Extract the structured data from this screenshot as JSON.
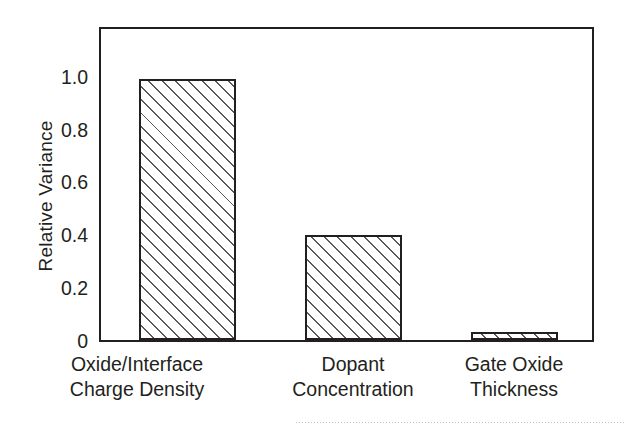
{
  "chart_data": {
    "type": "bar",
    "title": "",
    "xlabel": "",
    "ylabel": "Relative Variance",
    "categories": [
      "Oxide/Interface Charge Density",
      "Dopant Concentration",
      "Gate Oxide Thickness"
    ],
    "category_lines": [
      [
        "Oxide/Interface",
        "Charge Density"
      ],
      [
        "Dopant",
        "Concentration"
      ],
      [
        "Gate Oxide",
        "Thickness"
      ]
    ],
    "values": [
      1.0,
      0.4,
      0.03
    ],
    "ylim": [
      0,
      1.19
    ],
    "yticks": [
      0,
      0.2,
      0.4,
      0.6,
      0.8,
      1.0
    ],
    "ytick_labels": [
      "0",
      "0.2",
      "0.4",
      "0.6",
      "0.8",
      "1.0"
    ],
    "grid": false,
    "legend": false,
    "bar_fill": "white-diagonal-hatch",
    "bar_edge_color": "#231f20",
    "hatch_color": "#5a5a5a",
    "background_color": "#ffffff"
  }
}
